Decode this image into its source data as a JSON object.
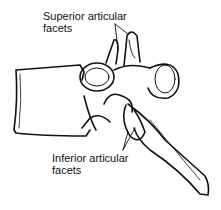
{
  "diagram": {
    "labels": {
      "superior_line1": "Superior articular",
      "superior_line2": "facets",
      "inferior_line1": "Inferior articular",
      "inferior_line2": "facets"
    },
    "colors": {
      "line": "#111111",
      "background": "#ffffff"
    }
  }
}
